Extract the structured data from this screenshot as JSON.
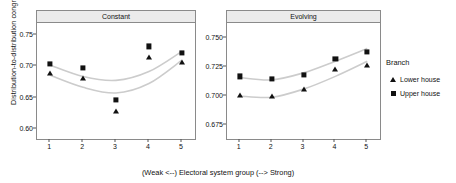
{
  "axis": {
    "ylabel": "Distribution-to-distribution congruence",
    "xlabel": "(Weak <--) Electoral system group (--> Strong)"
  },
  "legend": {
    "title": "Branch",
    "items": [
      {
        "label": "Lower house",
        "marker": "triangle-icon"
      },
      {
        "label": "Upper house",
        "marker": "square-icon"
      }
    ]
  },
  "colors": {
    "marker": "#111111",
    "fitline": "#cccccc",
    "strip_fill": "#ebebeb",
    "panel_border": "#8a8a8a"
  },
  "chart_data": {
    "type": "scatter",
    "title": "",
    "xlabel": "(Weak <--) Electoral system group (--> Strong)",
    "ylabel": "Distribution-to-distribution congruence",
    "grid": false,
    "legend_position": "right",
    "legend_title": "Branch",
    "x": [
      1,
      2,
      3,
      4,
      5
    ],
    "xtick_labels": [
      "1",
      "2",
      "3",
      "4",
      "5"
    ],
    "panels": [
      {
        "name": "Constant",
        "ylim": [
          0.583,
          0.767
        ],
        "ytick_labels": [
          "0.75",
          "0.70",
          "0.65",
          "0.60"
        ],
        "ytick_values": [
          0.75,
          0.7,
          0.65,
          0.6
        ],
        "series": [
          {
            "name": "Upper house",
            "marker": "square",
            "values": [
              0.702,
              0.696,
              0.645,
              0.73,
              0.72
            ]
          },
          {
            "name": "Lower house",
            "marker": "triangle",
            "values": [
              0.687,
              0.679,
              0.627,
              0.713,
              0.705
            ]
          }
        ],
        "fit_lines": [
          {
            "name": "Upper house",
            "points": [
              [
                1,
                0.7
              ],
              [
                2,
                0.682
              ],
              [
                3,
                0.676
              ],
              [
                4,
                0.69
              ],
              [
                5,
                0.722
              ]
            ]
          },
          {
            "name": "Lower house",
            "points": [
              [
                1,
                0.684
              ],
              [
                2,
                0.665
              ],
              [
                3,
                0.656
              ],
              [
                4,
                0.671
              ],
              [
                5,
                0.708
              ]
            ]
          }
        ]
      },
      {
        "name": "Evolving",
        "ylim": [
          0.662,
          0.762
        ],
        "ytick_labels": [
          "0.750",
          "0.725",
          "0.700",
          "0.675"
        ],
        "ytick_values": [
          0.75,
          0.725,
          0.7,
          0.675
        ],
        "series": [
          {
            "name": "Upper house",
            "marker": "square",
            "values": [
              0.716,
              0.714,
              0.717,
              0.731,
              0.737
            ]
          },
          {
            "name": "Lower house",
            "marker": "triangle",
            "values": [
              0.7,
              0.699,
              0.705,
              0.722,
              0.726
            ]
          }
        ],
        "fit_lines": [
          {
            "name": "Upper house",
            "points": [
              [
                1,
                0.715
              ],
              [
                2,
                0.713
              ],
              [
                3,
                0.719
              ],
              [
                4,
                0.729
              ],
              [
                5,
                0.74
              ]
            ]
          },
          {
            "name": "Lower house",
            "points": [
              [
                1,
                0.699
              ],
              [
                2,
                0.698
              ],
              [
                3,
                0.705
              ],
              [
                4,
                0.716
              ],
              [
                5,
                0.729
              ]
            ]
          }
        ]
      }
    ]
  }
}
